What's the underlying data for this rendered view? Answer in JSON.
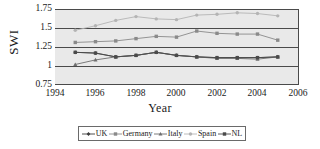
{
  "chart_data": {
    "type": "line",
    "title": "",
    "xlabel": "Year",
    "ylabel": "SWI",
    "xlim": [
      1994,
      2006
    ],
    "ylim": [
      0.75,
      1.75
    ],
    "xticks": [
      1994,
      1996,
      1998,
      2000,
      2002,
      2004,
      2006
    ],
    "yticks": [
      0.75,
      1,
      1.25,
      1.5,
      1.75
    ],
    "grid": true,
    "legend_position": "bottom",
    "x": [
      1995,
      1996,
      1997,
      1998,
      1999,
      2000,
      2001,
      2002,
      2003,
      2004,
      2005
    ],
    "series": [
      {
        "name": "UK",
        "color": "#3c3c3c",
        "marker": "diamond",
        "values": [
          1.18,
          1.17,
          1.12,
          1.14,
          1.18,
          1.14,
          1.12,
          1.11,
          1.11,
          1.11,
          1.12
        ]
      },
      {
        "name": "Germany",
        "color": "#8a8a8a",
        "marker": "square",
        "values": [
          1.31,
          1.32,
          1.33,
          1.36,
          1.39,
          1.38,
          1.46,
          1.43,
          1.42,
          1.42,
          1.34
        ]
      },
      {
        "name": "Italy",
        "color": "#6e6e6e",
        "marker": "triangle",
        "values": [
          1.02,
          1.08,
          1.12,
          1.14,
          1.18,
          1.14,
          1.12,
          1.1,
          1.1,
          1.09,
          1.12
        ]
      },
      {
        "name": "Spain",
        "color": "#b4b4b4",
        "marker": "cross",
        "values": [
          1.47,
          1.53,
          1.6,
          1.65,
          1.62,
          1.61,
          1.67,
          1.68,
          1.7,
          1.69,
          1.66
        ]
      },
      {
        "name": "NL",
        "color": "#4a4a4a",
        "marker": "square",
        "values": [
          1.18,
          1.17,
          1.12,
          1.14,
          1.18,
          1.14,
          1.12,
          1.11,
          1.11,
          1.11,
          1.12
        ]
      }
    ]
  },
  "axes": {
    "y_title": "SWI",
    "x_title": "Year",
    "y_ticks": [
      "1.75",
      "1.5",
      "1.25",
      "1",
      "0.75"
    ],
    "x_ticks": [
      "1994",
      "1996",
      "1998",
      "2000",
      "2002",
      "2004",
      "2006"
    ]
  },
  "legend": {
    "items": [
      {
        "label": "UK"
      },
      {
        "label": "Germany"
      },
      {
        "label": "Italy"
      },
      {
        "label": "Spain"
      },
      {
        "label": "NL"
      }
    ]
  }
}
